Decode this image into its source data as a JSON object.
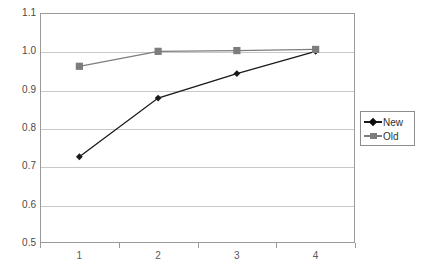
{
  "chart_data": {
    "type": "line",
    "title": "",
    "xlabel": "",
    "ylabel": "",
    "categories": [
      "1",
      "2",
      "3",
      "4"
    ],
    "ylim": [
      0.5,
      1.1
    ],
    "ytick_labels": [
      "1.1",
      "1.0",
      "0.9",
      "0.8",
      "0.7",
      "0.6",
      "0.5"
    ],
    "ytick_values": [
      1.1,
      1.0,
      0.9,
      0.8,
      0.7,
      0.6,
      0.5
    ],
    "grid": true,
    "legend_position": "right",
    "series": [
      {
        "name": "New",
        "color": "#1a1a1a",
        "marker": "diamond",
        "values": [
          0.725,
          0.878,
          0.942,
          1.0
        ]
      },
      {
        "name": "Old",
        "color": "#7d7d7d",
        "marker": "square",
        "values": [
          0.961,
          1.0,
          1.002,
          1.005
        ]
      }
    ]
  },
  "legend": {
    "items": [
      {
        "label": "New",
        "color": "#1a1a1a",
        "marker": "diamond-icon"
      },
      {
        "label": "Old",
        "color": "#7d7d7d",
        "marker": "square-icon"
      }
    ]
  },
  "colors": {
    "axis": "#9a9a9a",
    "grid": "#c8c8c8",
    "tick_text": "#4a4a4a",
    "background": "#ffffff"
  }
}
